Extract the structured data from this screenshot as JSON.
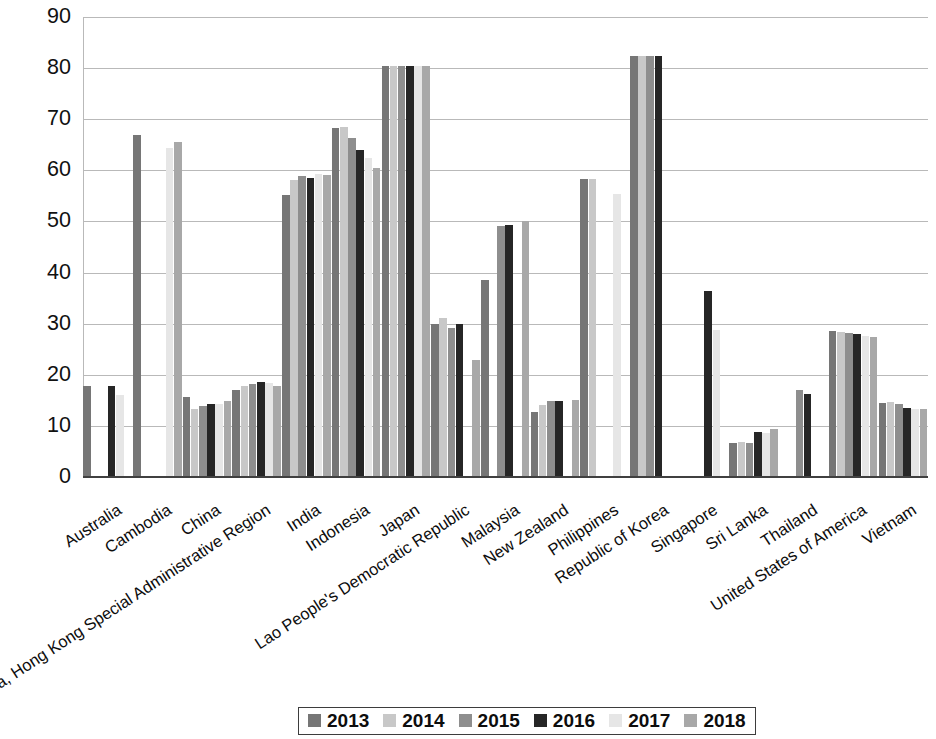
{
  "chart_data": {
    "type": "bar",
    "title": "",
    "subtitle": "",
    "xlabel": "",
    "ylabel": "",
    "ylim": [
      0,
      90
    ],
    "ytick_step": 10,
    "yticks": [
      0,
      10,
      20,
      30,
      40,
      50,
      60,
      70,
      80,
      90
    ],
    "grid": true,
    "legend_position": "bottom",
    "categories": [
      "Australia",
      "Cambodia",
      "China",
      "China, Hong Kong Special Administrative Region",
      "India",
      "Indonesia",
      "Japan",
      "Lao People's Democratic Republic",
      "Malaysia",
      "New Zealand",
      "Philippines",
      "Republic of Korea",
      "Singapore",
      "Sri Lanka",
      "Thailand",
      "United States of America",
      "Vietnam"
    ],
    "series": [
      {
        "name": "2013",
        "color": "#767676",
        "values": [
          17.9,
          67.0,
          15.7,
          17.0,
          55.1,
          68.3,
          80.4,
          29.9,
          38.6,
          12.8,
          58.4,
          82.3,
          null,
          6.7,
          null,
          28.6,
          14.5
        ]
      },
      {
        "name": "2014",
        "color": "#c8c8c8",
        "values": [
          null,
          null,
          13.4,
          17.9,
          58.1,
          68.4,
          80.5,
          31.2,
          null,
          14.0,
          58.4,
          82.3,
          null,
          6.8,
          null,
          28.4,
          14.7
        ]
      },
      {
        "name": "2015",
        "color": "#8e8e8e",
        "values": [
          null,
          null,
          13.8,
          18.2,
          58.9,
          66.3,
          80.4,
          29.1,
          49.2,
          14.8,
          null,
          82.3,
          null,
          6.6,
          17.0,
          28.2,
          14.2
        ]
      },
      {
        "name": "2016",
        "color": "#262626",
        "values": [
          17.9,
          null,
          14.3,
          18.6,
          58.6,
          63.9,
          80.5,
          29.9,
          49.3,
          14.8,
          null,
          82.3,
          36.3,
          8.8,
          16.3,
          27.9,
          13.6
        ]
      },
      {
        "name": "2017",
        "color": "#e6e6e6",
        "values": [
          16.0,
          64.4,
          14.2,
          18.3,
          59.3,
          62.4,
          80.4,
          null,
          null,
          null,
          55.3,
          null,
          28.8,
          8.6,
          null,
          27.5,
          13.4
        ]
      },
      {
        "name": "2018",
        "color": "#a8a8a8",
        "values": [
          null,
          65.5,
          14.8,
          17.9,
          59.0,
          60.5,
          80.4,
          22.8,
          50.1,
          15.1,
          null,
          null,
          null,
          9.3,
          null,
          27.3,
          13.3
        ]
      }
    ]
  },
  "legend": {
    "items": [
      {
        "label": "2013",
        "color": "#767676"
      },
      {
        "label": "2014",
        "color": "#c8c8c8"
      },
      {
        "label": "2015",
        "color": "#8e8e8e"
      },
      {
        "label": "2016",
        "color": "#262626"
      },
      {
        "label": "2017",
        "color": "#e6e6e6"
      },
      {
        "label": "2018",
        "color": "#a8a8a8"
      }
    ]
  },
  "axis": {
    "y_tick_labels": [
      "90",
      "80",
      "70",
      "60",
      "50",
      "40",
      "30",
      "20",
      "10",
      "0"
    ]
  }
}
